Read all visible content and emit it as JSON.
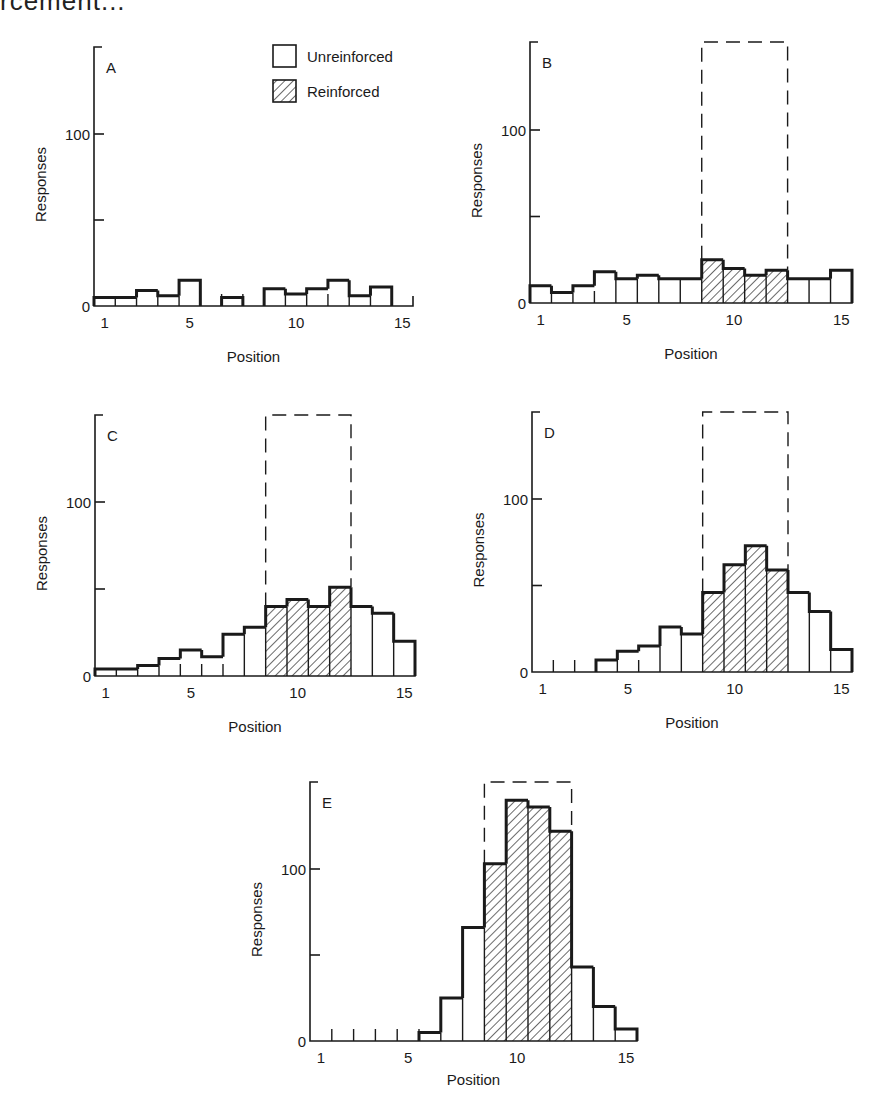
{
  "caption_fragment": "rcement...",
  "legend": {
    "unreinforced_label": "Unreinforced",
    "reinforced_label": "Reinforced"
  },
  "colors": {
    "ink": "#1a1a1a",
    "background": "#ffffff"
  },
  "chart_data": [
    {
      "type": "bar",
      "panel": "A",
      "title": "A",
      "xlabel": "Position",
      "ylabel": "Responses",
      "categories": [
        1,
        2,
        3,
        4,
        5,
        6,
        7,
        8,
        9,
        10,
        11,
        12,
        13,
        14,
        15
      ],
      "x_tick_labels": [
        "1",
        "5",
        "10",
        "15"
      ],
      "y_tick_labels": [
        "0",
        "100"
      ],
      "ylim": [
        0,
        150
      ],
      "reinforced_range": null,
      "series": [
        {
          "name": "Responses",
          "values": [
            5,
            5,
            9,
            6,
            15,
            0,
            5,
            0,
            10,
            7,
            10,
            15,
            6,
            11,
            0
          ]
        }
      ]
    },
    {
      "type": "bar",
      "panel": "B",
      "title": "B",
      "xlabel": "Position",
      "ylabel": "Responses",
      "categories": [
        1,
        2,
        3,
        4,
        5,
        6,
        7,
        8,
        9,
        10,
        11,
        12,
        13,
        14,
        15
      ],
      "x_tick_labels": [
        "1",
        "5",
        "10",
        "15"
      ],
      "y_tick_labels": [
        "0",
        "100"
      ],
      "ylim": [
        0,
        150
      ],
      "reinforced_range": [
        9,
        12
      ],
      "series": [
        {
          "name": "Responses",
          "values": [
            10,
            6,
            10,
            18,
            14,
            16,
            14,
            14,
            25,
            20,
            16,
            19,
            14,
            14,
            19
          ]
        }
      ]
    },
    {
      "type": "bar",
      "panel": "C",
      "title": "C",
      "xlabel": "Position",
      "ylabel": "Responses",
      "categories": [
        1,
        2,
        3,
        4,
        5,
        6,
        7,
        8,
        9,
        10,
        11,
        12,
        13,
        14,
        15
      ],
      "x_tick_labels": [
        "1",
        "5",
        "10",
        "15"
      ],
      "y_tick_labels": [
        "0",
        "100"
      ],
      "ylim": [
        0,
        150
      ],
      "reinforced_range": [
        9,
        12
      ],
      "series": [
        {
          "name": "Responses",
          "values": [
            4,
            4,
            6,
            10,
            15,
            11,
            24,
            28,
            40,
            44,
            40,
            51,
            40,
            36,
            20
          ]
        }
      ]
    },
    {
      "type": "bar",
      "panel": "D",
      "title": "D",
      "xlabel": "Position",
      "ylabel": "Responses",
      "categories": [
        1,
        2,
        3,
        4,
        5,
        6,
        7,
        8,
        9,
        10,
        11,
        12,
        13,
        14,
        15
      ],
      "x_tick_labels": [
        "1",
        "5",
        "10",
        "15"
      ],
      "y_tick_labels": [
        "0",
        "100"
      ],
      "ylim": [
        0,
        150
      ],
      "reinforced_range": [
        9,
        12
      ],
      "series": [
        {
          "name": "Responses",
          "values": [
            0,
            0,
            0,
            7,
            12,
            15,
            26,
            22,
            46,
            62,
            73,
            59,
            46,
            35,
            13
          ]
        }
      ]
    },
    {
      "type": "bar",
      "panel": "E",
      "title": "E",
      "xlabel": "Position",
      "ylabel": "Responses",
      "categories": [
        1,
        2,
        3,
        4,
        5,
        6,
        7,
        8,
        9,
        10,
        11,
        12,
        13,
        14,
        15
      ],
      "x_tick_labels": [
        "1",
        "5",
        "10",
        "15"
      ],
      "y_tick_labels": [
        "0",
        "100"
      ],
      "ylim": [
        0,
        150
      ],
      "reinforced_range": [
        9,
        12
      ],
      "series": [
        {
          "name": "Responses",
          "values": [
            0,
            0,
            0,
            0,
            0,
            5,
            25,
            66,
            103,
            140,
            136,
            122,
            43,
            20,
            7
          ]
        }
      ]
    }
  ],
  "layout": {
    "panels": [
      {
        "x0": 94,
        "x1": 413,
        "y0": 306,
        "y100": 134,
        "ytop": 47
      },
      {
        "x0": 530,
        "x1": 852,
        "y0": 303,
        "y100": 130,
        "ytop": 42
      },
      {
        "x0": 95,
        "x1": 415,
        "y0": 676,
        "y100": 502,
        "ytop": 415
      },
      {
        "x0": 532,
        "x1": 852,
        "y0": 672,
        "y100": 499,
        "ytop": 412
      },
      {
        "x0": 310,
        "x1": 637,
        "y0": 1041,
        "y100": 869,
        "ytop": 782
      }
    ]
  }
}
